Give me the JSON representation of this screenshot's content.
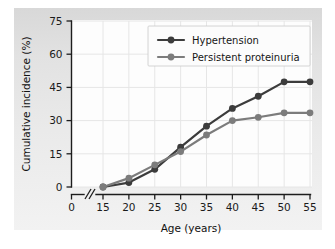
{
  "chart_data": {
    "type": "line",
    "title": "",
    "xlabel": "Age (years)",
    "ylabel": "Cumulative incidence (%)",
    "xlim": [
      15,
      55
    ],
    "ylim": [
      0,
      75
    ],
    "xticks": [
      0,
      15,
      20,
      25,
      30,
      35,
      40,
      45,
      50,
      55
    ],
    "yticks": [
      0,
      15,
      30,
      45,
      60,
      75
    ],
    "xtick_labels": [
      "0",
      "15",
      "20",
      "25",
      "30",
      "35",
      "40",
      "45",
      "50",
      "55"
    ],
    "ytick_labels": [
      "0",
      "15",
      "30",
      "45",
      "60",
      "75"
    ],
    "axis_break": true,
    "axis_break_note": "//",
    "grid": true,
    "legend_position": "upper center",
    "x": [
      15,
      20,
      25,
      30,
      35,
      40,
      45,
      50,
      55
    ],
    "series": [
      {
        "name": "Hypertension",
        "color": "#3c3c3c",
        "marker": "circle",
        "values": [
          0,
          2,
          8,
          18,
          27.5,
          35.5,
          41,
          47.5,
          47.5
        ]
      },
      {
        "name": "Persistent proteinuria",
        "color": "#7c7c7c",
        "marker": "circle",
        "values": [
          0,
          4,
          10,
          16,
          23.5,
          30,
          31.5,
          33.5,
          33.5
        ]
      }
    ]
  },
  "legend": {
    "items": [
      {
        "label": "Hypertension"
      },
      {
        "label": "Persistent proteinuria"
      }
    ]
  },
  "axes": {
    "x_title": "Age (years)",
    "y_title": "Cumulative incidence (%)"
  },
  "colors": {
    "hypertension": "#3c3c3c",
    "proteinuria": "#7c7c7c",
    "axis": "#1d1d1d",
    "grid": "#e6e6e6",
    "panel": "#e6e6e6",
    "plot_background": "#fdfdfd"
  }
}
